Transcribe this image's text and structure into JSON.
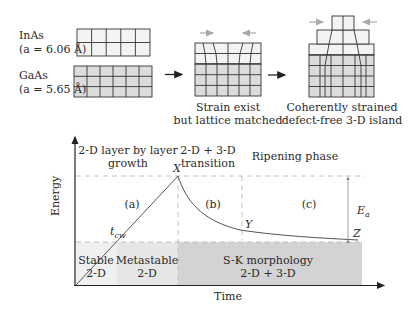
{
  "materials": {
    "top": {
      "name": "InAs",
      "lattice": "(a = 6.06 Å)"
    },
    "bottom": {
      "name": "GaAs",
      "lattice": "(a = 5.65 Å)"
    }
  },
  "stages": [
    {
      "caption_line1": "Strain exist",
      "caption_line2": "but lattice matched"
    },
    {
      "caption_line1": "Coherently strained",
      "caption_line2": "defect-free 3-D island"
    }
  ],
  "graph": {
    "y_axis_label": "Energy",
    "x_axis_label": "Time",
    "phase_labels": {
      "growth_line1": "2-D layer by layer",
      "growth_line2": "growth",
      "transition_line1": "2-D + 3-D",
      "transition_line2": "transition",
      "ripening": "Ripening phase"
    },
    "region_markers": {
      "a": "(a)",
      "b": "(b)",
      "c": "(c)"
    },
    "points": {
      "X": "X",
      "Y": "Y",
      "Z": "Z",
      "tcw": "t",
      "tcw_sub": "cw"
    },
    "energy_label": "E",
    "energy_sub": "a",
    "bottom_regions": {
      "stable_line1": "Stable",
      "stable_line2": "2-D",
      "metastable_line1": "Metastable",
      "metastable_line2": "2-D",
      "sk_line1": "S-K morphology",
      "sk_line2": "2-D + 3-D"
    }
  }
}
